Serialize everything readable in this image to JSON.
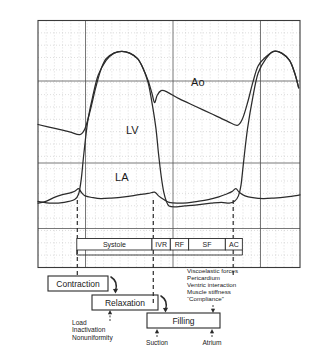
{
  "figure": {
    "title_visible": false,
    "type": "cardiac-pressure-waveform-diagram"
  },
  "chart_data": {
    "type": "line",
    "title": "",
    "xlabel": "",
    "ylabel": "",
    "xlim": [
      0,
      100
    ],
    "ylim": [
      0,
      100
    ],
    "grid": true,
    "legend_position": "inline-annotations",
    "series": [
      {
        "name": "Ao",
        "label": "Ao",
        "label_x": 61,
        "label_y": 71,
        "description": "Aortic pressure: slow diastolic runoff decay, sharp systolic upstroke, dicrotic notch then decay",
        "points": [
          [
            0,
            50
          ],
          [
            6,
            48
          ],
          [
            12,
            46
          ],
          [
            16,
            44.5
          ],
          [
            18,
            48
          ],
          [
            20,
            58
          ],
          [
            22,
            70
          ],
          [
            24,
            80
          ],
          [
            26,
            86
          ],
          [
            29,
            89
          ],
          [
            32,
            90
          ],
          [
            35,
            89
          ],
          [
            38,
            86
          ],
          [
            40,
            81
          ],
          [
            42,
            74
          ],
          [
            43.5,
            67
          ],
          [
            44.5,
            62
          ],
          [
            45.5,
            66
          ],
          [
            47,
            68.5
          ],
          [
            49,
            68
          ],
          [
            54,
            64
          ],
          [
            60,
            60
          ],
          [
            66,
            56
          ],
          [
            72,
            52
          ],
          [
            76,
            49.5
          ],
          [
            78,
            53
          ],
          [
            80,
            62
          ],
          [
            82,
            73
          ],
          [
            84,
            82
          ],
          [
            87,
            87
          ],
          [
            90,
            90
          ],
          [
            93,
            89
          ],
          [
            96,
            85
          ],
          [
            98,
            78
          ],
          [
            99.5,
            70
          ]
        ]
      },
      {
        "name": "LV",
        "label": "LV",
        "label_x": 36,
        "label_y": 45,
        "description": "Left ventricular pressure: isovolumic contraction, ejection, rapid isovolumic relaxation to near-zero, slow diastolic filling rise",
        "points": [
          [
            0,
            8
          ],
          [
            5,
            7
          ],
          [
            10,
            7.5
          ],
          [
            14,
            9
          ],
          [
            15.5,
            12
          ],
          [
            16.5,
            20
          ],
          [
            17.5,
            34
          ],
          [
            19,
            52
          ],
          [
            21,
            66
          ],
          [
            23,
            77
          ],
          [
            26,
            85
          ],
          [
            29,
            89
          ],
          [
            32,
            90
          ],
          [
            35,
            89
          ],
          [
            38,
            86
          ],
          [
            40,
            81
          ],
          [
            42,
            73
          ],
          [
            43.5,
            62
          ],
          [
            45,
            48
          ],
          [
            46,
            34
          ],
          [
            47,
            22
          ],
          [
            48,
            13
          ],
          [
            49,
            8
          ],
          [
            50,
            5.5
          ],
          [
            52,
            5
          ],
          [
            56,
            5.5
          ],
          [
            60,
            6
          ],
          [
            66,
            7
          ],
          [
            70,
            7.5
          ],
          [
            73,
            7
          ],
          [
            75,
            8
          ],
          [
            76.5,
            11
          ],
          [
            77.5,
            17
          ],
          [
            78.5,
            30
          ],
          [
            80,
            48
          ],
          [
            82,
            65
          ],
          [
            84,
            78
          ],
          [
            87,
            86
          ],
          [
            90,
            90
          ],
          [
            93,
            89
          ],
          [
            96,
            85
          ],
          [
            98,
            78
          ],
          [
            99.5,
            70
          ]
        ]
      },
      {
        "name": "LA",
        "label": "LA",
        "label_x": 32,
        "label_y": 19,
        "description": "Left atrial pressure: a-wave, c-wave, x-descent, v-wave, y-descent; remains low throughout",
        "points": [
          [
            0,
            7
          ],
          [
            3,
            8
          ],
          [
            6,
            10
          ],
          [
            9,
            11.5
          ],
          [
            12,
            12.5
          ],
          [
            14,
            13.5
          ],
          [
            15.5,
            15
          ],
          [
            16.5,
            13
          ],
          [
            18,
            11
          ],
          [
            21,
            10
          ],
          [
            24,
            9.5
          ],
          [
            28,
            9.8
          ],
          [
            33,
            10.5
          ],
          [
            38,
            11.5
          ],
          [
            42,
            12.3
          ],
          [
            44.5,
            13
          ],
          [
            46,
            11
          ],
          [
            48,
            9
          ],
          [
            50,
            7.5
          ],
          [
            53,
            7
          ],
          [
            57,
            7.2
          ],
          [
            61,
            8
          ],
          [
            65,
            9
          ],
          [
            69,
            10.5
          ],
          [
            72,
            12
          ],
          [
            74,
            13.3
          ],
          [
            75.5,
            15
          ],
          [
            76.8,
            13
          ],
          [
            79,
            11
          ],
          [
            82,
            10
          ],
          [
            86,
            9.5
          ],
          [
            90,
            9.8
          ],
          [
            95,
            10.5
          ],
          [
            100,
            11.5
          ]
        ]
      }
    ],
    "phase_bar": {
      "label": "cardiac-cycle-phases",
      "segments": [
        {
          "code": "Systole",
          "start": 14.8,
          "end": 43.5
        },
        {
          "code": "IVR",
          "start": 43.5,
          "end": 50.5
        },
        {
          "code": "RF",
          "start": 50.5,
          "end": 57.5
        },
        {
          "code": "SF",
          "start": 57.5,
          "end": 71.5
        },
        {
          "code": "AC",
          "start": 71.5,
          "end": 78.0
        }
      ]
    },
    "event_markers": [
      {
        "name": "mitral-valve-closure",
        "x": 15.0
      },
      {
        "name": "aortic-valve-closure",
        "x": 44.0
      },
      {
        "name": "atrial-contraction-onset",
        "x": 74.5
      }
    ]
  },
  "process_boxes": [
    {
      "id": "contraction",
      "label": "Contraction"
    },
    {
      "id": "relaxation",
      "label": "Relaxation"
    },
    {
      "id": "filling",
      "label": "Filling"
    }
  ],
  "annotations": {
    "relaxation_determinants": {
      "name": "relaxation-determinants",
      "lines": [
        "Load",
        "Inactivation",
        "Nonuniformity"
      ]
    },
    "filling_determinants": {
      "name": "filling-determinants",
      "lines": [
        "Viscoelastic forces",
        "Pericardium",
        "Ventric interaction",
        "Muscle stiffness",
        "“Compliance”"
      ]
    },
    "filling_sources": {
      "name": "filling-sources",
      "left": "Suction",
      "right": "Atrium"
    }
  },
  "colors": {
    "curve": "#2b2b2b",
    "major_grid": "#555555",
    "dot_grid": "#b9b9b9",
    "frame": "#3a3a3a",
    "background": "#ffffff"
  }
}
